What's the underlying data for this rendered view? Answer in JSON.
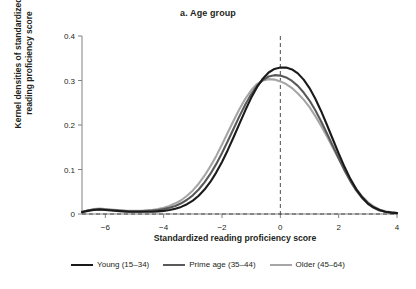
{
  "chart_data": {
    "type": "line",
    "title": "a. Age group",
    "xlabel": "Standardized reading proficiency score",
    "ylabel_line1": "Kernel densities of standardized",
    "ylabel_line2": "reading proficiency score",
    "xlim": [
      -6.8,
      4
    ],
    "ylim": [
      0,
      0.4
    ],
    "xticks": [
      -6,
      -4,
      -2,
      0,
      2,
      4
    ],
    "xticklabels": [
      "−6",
      "−4",
      "−2",
      "0",
      "2",
      "4"
    ],
    "yticks": [
      0,
      0.1,
      0.2,
      0.3,
      0.4
    ],
    "yticklabels": [
      "0",
      "0.1",
      "0.2",
      "0.3",
      "0.4"
    ],
    "grid": false,
    "legend_position": "bottom",
    "reference_lines": [
      {
        "name": "vertical-zero",
        "orientation": "vertical",
        "value": 0,
        "style": "dashed"
      },
      {
        "name": "horizontal-zero",
        "orientation": "horizontal",
        "value": 0,
        "style": "dashed"
      }
    ],
    "x": [
      -6.8,
      -6.6,
      -6.4,
      -6.2,
      -6.0,
      -5.8,
      -5.6,
      -5.4,
      -5.2,
      -5.0,
      -4.8,
      -4.6,
      -4.4,
      -4.2,
      -4.0,
      -3.8,
      -3.6,
      -3.4,
      -3.2,
      -3.0,
      -2.8,
      -2.6,
      -2.4,
      -2.2,
      -2.0,
      -1.8,
      -1.6,
      -1.4,
      -1.2,
      -1.0,
      -0.8,
      -0.6,
      -0.4,
      -0.2,
      0.0,
      0.2,
      0.4,
      0.6,
      0.8,
      1.0,
      1.2,
      1.4,
      1.6,
      1.8,
      2.0,
      2.2,
      2.4,
      2.6,
      2.8,
      3.0,
      3.2,
      3.4,
      3.6,
      3.8,
      4.0
    ],
    "series": [
      {
        "name": "Young (15–34)",
        "color": "#1a1a1a",
        "width": 2.1,
        "values": [
          0.004,
          0.007,
          0.009,
          0.01,
          0.009,
          0.008,
          0.007,
          0.006,
          0.005,
          0.005,
          0.005,
          0.005,
          0.005,
          0.006,
          0.007,
          0.009,
          0.012,
          0.016,
          0.022,
          0.03,
          0.041,
          0.055,
          0.072,
          0.093,
          0.117,
          0.144,
          0.173,
          0.203,
          0.233,
          0.261,
          0.285,
          0.304,
          0.318,
          0.326,
          0.329,
          0.329,
          0.325,
          0.316,
          0.302,
          0.283,
          0.259,
          0.231,
          0.2,
          0.168,
          0.136,
          0.106,
          0.079,
          0.056,
          0.038,
          0.024,
          0.015,
          0.009,
          0.005,
          0.003,
          0.002
        ]
      },
      {
        "name": "Prime age (35–44)",
        "color": "#595959",
        "width": 2.1,
        "values": [
          0.005,
          0.008,
          0.01,
          0.011,
          0.01,
          0.009,
          0.008,
          0.007,
          0.006,
          0.006,
          0.006,
          0.007,
          0.008,
          0.009,
          0.011,
          0.014,
          0.018,
          0.024,
          0.032,
          0.042,
          0.055,
          0.071,
          0.09,
          0.112,
          0.137,
          0.164,
          0.192,
          0.22,
          0.246,
          0.269,
          0.288,
          0.301,
          0.309,
          0.312,
          0.311,
          0.307,
          0.299,
          0.288,
          0.273,
          0.255,
          0.233,
          0.208,
          0.181,
          0.153,
          0.125,
          0.098,
          0.074,
          0.053,
          0.036,
          0.023,
          0.014,
          0.008,
          0.005,
          0.003,
          0.002
        ]
      },
      {
        "name": "Older (45–64)",
        "color": "#a6a6a6",
        "width": 2.1,
        "values": [
          0.005,
          0.008,
          0.011,
          0.012,
          0.011,
          0.01,
          0.009,
          0.008,
          0.007,
          0.007,
          0.007,
          0.008,
          0.009,
          0.011,
          0.014,
          0.018,
          0.024,
          0.031,
          0.041,
          0.053,
          0.068,
          0.086,
          0.107,
          0.13,
          0.156,
          0.183,
          0.21,
          0.236,
          0.259,
          0.278,
          0.292,
          0.3,
          0.303,
          0.302,
          0.298,
          0.292,
          0.283,
          0.271,
          0.257,
          0.24,
          0.22,
          0.198,
          0.174,
          0.149,
          0.124,
          0.1,
          0.077,
          0.057,
          0.04,
          0.027,
          0.017,
          0.01,
          0.006,
          0.004,
          0.002
        ]
      }
    ]
  }
}
